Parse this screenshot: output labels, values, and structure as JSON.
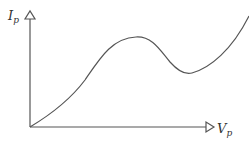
{
  "diagram": {
    "type": "iv-characteristic-curve",
    "y_axis": {
      "symbol": "I",
      "subscript": "p"
    },
    "x_axis": {
      "symbol": "V",
      "subscript": "p"
    },
    "curve": {
      "description": "rises from origin to a peak, dips to a valley, then rises steeply",
      "points": [
        [
          30,
          127
        ],
        [
          80,
          90
        ],
        [
          136,
          37
        ],
        [
          190,
          73
        ],
        [
          249,
          15
        ]
      ]
    },
    "colors": {
      "line": "#555555",
      "text": "#333333",
      "background": "#ffffff"
    }
  }
}
